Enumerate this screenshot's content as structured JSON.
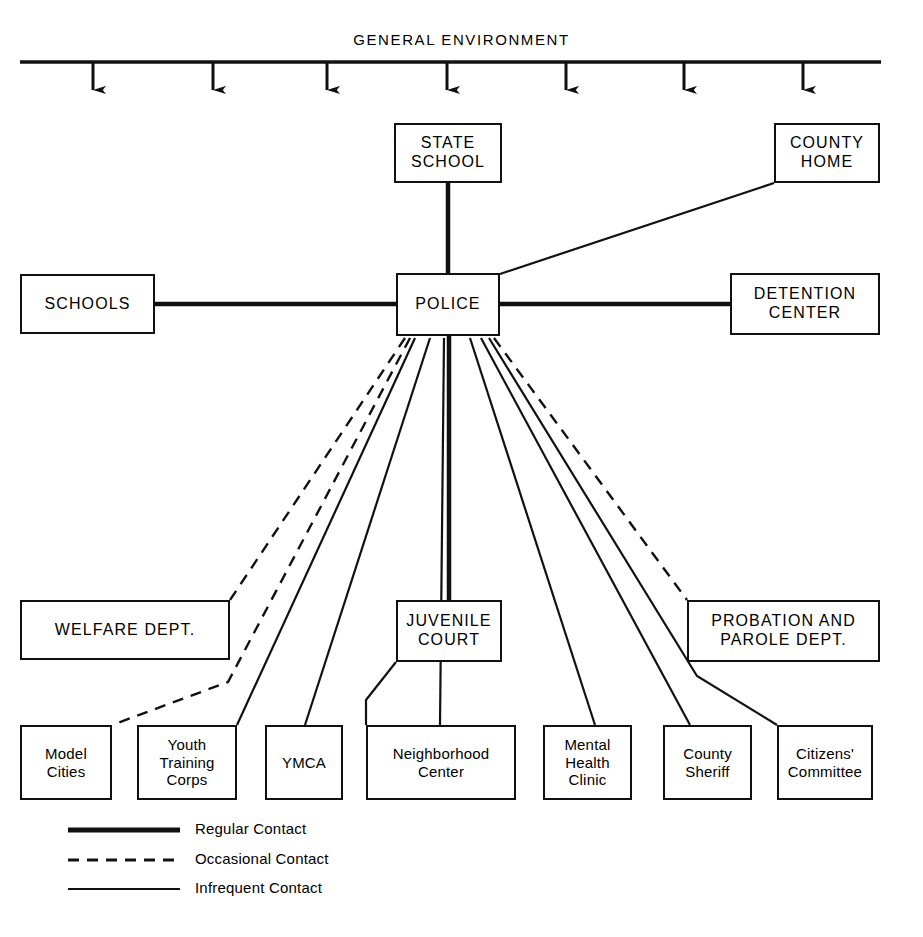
{
  "diagram": {
    "title": "GENERAL ENVIRONMENT",
    "environment_arrow_count": 7
  },
  "nodes": {
    "state_school": "STATE\nSCHOOL",
    "county_home": "COUNTY\nHOME",
    "schools": "SCHOOLS",
    "police": "POLICE",
    "detention_center": "DETENTION\nCENTER",
    "welfare_dept": "WELFARE DEPT.",
    "juvenile_court": "JUVENILE\nCOURT",
    "probation_parole": "PROBATION AND\nPAROLE DEPT.",
    "model_cities": "Model\nCities",
    "youth_training_corps": "Youth\nTraining\nCorps",
    "ymca": "YMCA",
    "neighborhood_center": "Neighborhood\nCenter",
    "mental_health_clinic": "Mental\nHealth\nClinic",
    "county_sheriff": "County\nSheriff",
    "citizens_committee": "Citizens'\nCommittee"
  },
  "legend": {
    "items": [
      {
        "label": "Regular Contact",
        "style": "thick-solid"
      },
      {
        "label": "Occasional Contact",
        "style": "dashed"
      },
      {
        "label": "Infrequent Contact",
        "style": "thin-solid"
      }
    ]
  },
  "colors": {
    "ink": "#111111",
    "paper": "#ffffff"
  }
}
